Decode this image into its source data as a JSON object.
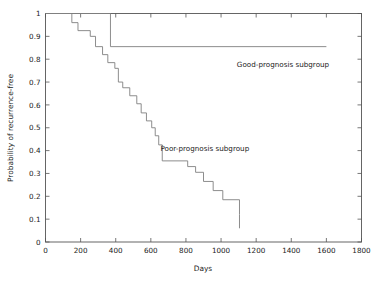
{
  "chart_data": {
    "type": "line",
    "subtype": "kaplan-meier-step",
    "title": "",
    "xlabel": "Days",
    "ylabel": "Probability of recurrence-free",
    "xlim": [
      0,
      1800
    ],
    "ylim": [
      0,
      1
    ],
    "xticks": [
      0,
      200,
      400,
      600,
      800,
      1000,
      1200,
      1400,
      1600,
      1800
    ],
    "xtick_labels": [
      "0",
      "200",
      "400",
      "600",
      "800",
      "1000",
      "1200",
      "1400",
      "1600",
      "1800"
    ],
    "yticks": [
      0,
      0.1,
      0.2,
      0.3,
      0.4,
      0.5,
      0.6,
      0.7,
      0.8,
      0.9,
      1
    ],
    "ytick_labels": [
      "0",
      "0.1",
      "0.2",
      "0.3",
      "0.4",
      "0.5",
      "0.6",
      "0.7",
      "0.8",
      "0.9",
      "1"
    ],
    "grid": false,
    "legend_position": "inline-annotation",
    "frame": "box",
    "tick_direction": "in",
    "series": [
      {
        "name": "Good-prognosis subgroup",
        "annotation": "Good-prognosis subgroup",
        "annotation_x": 1090,
        "annotation_y": 0.765,
        "color": "#808080",
        "x": [
          0,
          370,
          370,
          1600
        ],
        "y": [
          1,
          1,
          0.855,
          0.855
        ],
        "steps": [
          {
            "day": 0,
            "prob": 1.0
          },
          {
            "day": 370,
            "prob": 0.855
          },
          {
            "day": 1600,
            "prob": 0.855
          }
        ]
      },
      {
        "name": "Poor-prognosis subgroup",
        "annotation": "Poor-prognosis subgroup",
        "annotation_x": 655,
        "annotation_y": 0.4,
        "color": "#808080",
        "steps": [
          {
            "day": 0,
            "prob": 1.0
          },
          {
            "day": 150,
            "prob": 0.96
          },
          {
            "day": 185,
            "prob": 0.925
          },
          {
            "day": 255,
            "prob": 0.9
          },
          {
            "day": 285,
            "prob": 0.855
          },
          {
            "day": 325,
            "prob": 0.82
          },
          {
            "day": 355,
            "prob": 0.785
          },
          {
            "day": 395,
            "prob": 0.76
          },
          {
            "day": 415,
            "prob": 0.7
          },
          {
            "day": 440,
            "prob": 0.675
          },
          {
            "day": 480,
            "prob": 0.64
          },
          {
            "day": 520,
            "prob": 0.605
          },
          {
            "day": 545,
            "prob": 0.565
          },
          {
            "day": 575,
            "prob": 0.53
          },
          {
            "day": 605,
            "prob": 0.5
          },
          {
            "day": 625,
            "prob": 0.465
          },
          {
            "day": 645,
            "prob": 0.425
          },
          {
            "day": 665,
            "prob": 0.355
          },
          {
            "day": 810,
            "prob": 0.33
          },
          {
            "day": 855,
            "prob": 0.305
          },
          {
            "day": 900,
            "prob": 0.265
          },
          {
            "day": 955,
            "prob": 0.225
          },
          {
            "day": 1010,
            "prob": 0.185
          },
          {
            "day": 1105,
            "prob": 0.12
          }
        ]
      }
    ]
  },
  "axes": {
    "x_title": "Days",
    "y_title": "Probability of recurrence-free"
  },
  "annotations": {
    "good": "Good-prognosis subgroup",
    "poor": "Poor-prognosis subgroup"
  },
  "colors": {
    "curve": "#808080",
    "frame": "#555555",
    "text": "#1a1a1a",
    "background": "#ffffff"
  }
}
